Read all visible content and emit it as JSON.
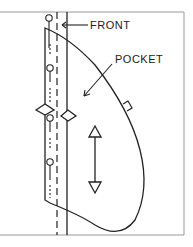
{
  "diagram": {
    "type": "sewing-pattern",
    "labels": {
      "front": "FRONT",
      "pocket": "POCKET"
    },
    "colors": {
      "line": "#222222",
      "frame": "#999999",
      "background": "#ffffff"
    },
    "elements": [
      "front-edge-solid-line",
      "fold-dashed-line",
      "pocket-outline",
      "pins",
      "notches",
      "grainline-arrow",
      "pocket-tab"
    ]
  }
}
